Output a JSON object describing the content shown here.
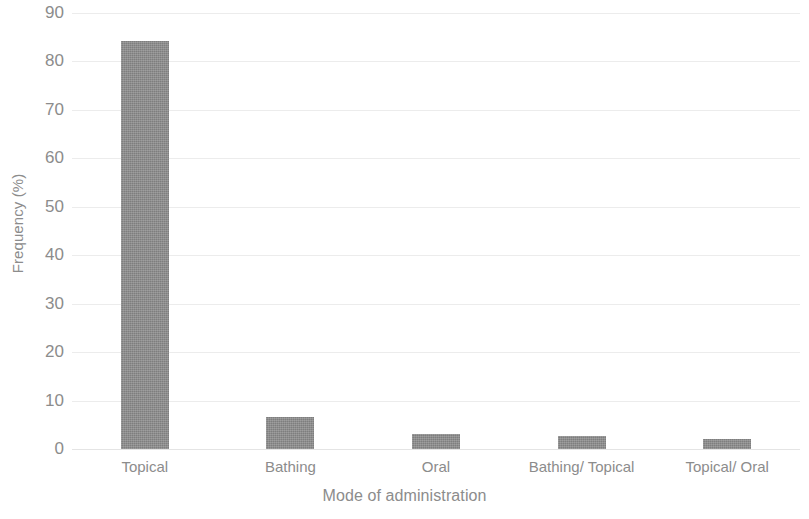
{
  "chart_data": {
    "type": "bar",
    "title": "",
    "subtitle": "",
    "xlabel": "Mode of administration",
    "ylabel": "Frequency (%)",
    "categories": [
      "Topical",
      "Bathing",
      "Oral",
      "Bathing/ Topical",
      "Topical/ Oral"
    ],
    "values": [
      84.3,
      6.6,
      3.1,
      2.7,
      2.1
    ],
    "series": [
      {
        "name": "Frequency",
        "values": [
          84.3,
          6.6,
          3.1,
          2.7,
          2.1
        ]
      }
    ],
    "ylim": [
      0,
      90
    ],
    "xlim": null,
    "y_ticks": [
      0,
      10,
      20,
      30,
      40,
      50,
      60,
      70,
      80,
      90
    ],
    "y_tick_labels": [
      "0",
      "10",
      "20",
      "30",
      "40",
      "50",
      "60",
      "70",
      "80",
      "90"
    ],
    "grid": true,
    "grid_axis": "y",
    "legend": false,
    "legend_position": "none",
    "bar_color": "#8b8b8b",
    "grid_color": "#ececec",
    "text_color": "#8c8c8c",
    "background_color": "#ffffff",
    "annotations": []
  }
}
